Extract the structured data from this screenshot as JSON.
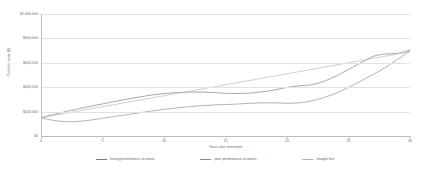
{
  "chart_data": {
    "type": "line",
    "title": "",
    "xlabel": "Years after retirement",
    "ylabel": "Portfolio value ($)",
    "xlim": [
      0,
      30
    ],
    "ylim": [
      0,
      1000000
    ],
    "grid": true,
    "legend_position": "bottom",
    "x_ticks": [
      "0",
      "5",
      "10",
      "15",
      "20",
      "25",
      "30"
    ],
    "x_tick_values": [
      0,
      5,
      10,
      15,
      20,
      25,
      30
    ],
    "y_ticks": [
      "$1,000,000",
      "$800,000",
      "$600,000",
      "$400,000",
      "$200,000",
      "$0"
    ],
    "y_tick_values": [
      1000000,
      800000,
      600000,
      400000,
      200000,
      0
    ],
    "x": [
      0,
      1,
      2,
      3,
      4,
      5,
      6,
      7,
      8,
      9,
      10,
      11,
      12,
      13,
      14,
      15,
      16,
      17,
      18,
      19,
      20,
      21,
      22,
      23,
      24,
      25,
      26,
      27,
      28,
      29,
      30
    ],
    "series": [
      {
        "name": "strong performance at outset",
        "color": "#7a7a7a",
        "style": "solid",
        "values": [
          150000,
          175000,
          200000,
          222000,
          243000,
          263000,
          283000,
          302000,
          320000,
          336000,
          348000,
          356000,
          360000,
          360000,
          356000,
          350000,
          348000,
          352000,
          362000,
          378000,
          398000,
          412000,
          420000,
          448000,
          492000,
          545000,
          600000,
          652000,
          672000,
          678000,
          705000
        ]
      },
      {
        "name": "poor performance at outset",
        "color": "#8a8a8a",
        "style": "solid",
        "values": [
          150000,
          128000,
          118000,
          120000,
          130000,
          145000,
          160000,
          175000,
          190000,
          205000,
          218000,
          230000,
          240000,
          248000,
          254000,
          258000,
          262000,
          268000,
          272000,
          272000,
          268000,
          272000,
          288000,
          315000,
          352000,
          398000,
          450000,
          505000,
          562000,
          628000,
          700000
        ]
      },
      {
        "name": "straight line",
        "color": "#b5b5b5",
        "style": "solid",
        "values": [
          150000,
          168000,
          186000,
          204000,
          222000,
          240000,
          258000,
          276000,
          294000,
          312000,
          330000,
          348000,
          366000,
          384000,
          402000,
          420000,
          438000,
          456000,
          474000,
          492000,
          510000,
          528000,
          546000,
          564000,
          582000,
          600000,
          618000,
          636000,
          654000,
          672000,
          690000
        ]
      }
    ]
  }
}
